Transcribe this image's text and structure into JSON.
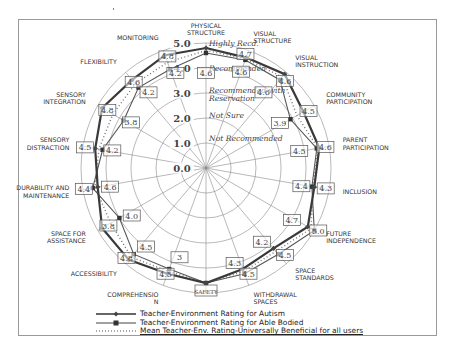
{
  "chart_data": {
    "type": "radar",
    "title": "",
    "axes": [
      "PHYSICAL STRUCTURE",
      "VISUAL STRUCTURE",
      "VISUAL INSTRUCTION",
      "COMMUNITY PARTICIPATION",
      "PARENT PARTICIPATION",
      "INCLUSION",
      "FUTURE INDEPENDENCE",
      "SPACE STANDARDS",
      "WITHDRAWAL SPACES",
      "SAFETY",
      "COMPREHENSION",
      "ACCESSIBILITY",
      "SPACE FOR ASSISTANCE",
      "DURABILITY AND MAINTENANCE",
      "SENSORY DISTRACTION",
      "SENSORY INTEGRATION",
      "FLEXIBILITY",
      "MONITORING"
    ],
    "axis_label_lines": [
      [
        "PHYSICAL",
        "STRUCTURE"
      ],
      [
        "VISUAL",
        "STRUCTURE"
      ],
      [
        "VISUAL",
        "INSTRUCTION"
      ],
      [
        "COMMUNITY",
        "PARTICIPATION"
      ],
      [
        "PARENT",
        "PARTICIPATION"
      ],
      [
        "INCLUSION"
      ],
      [
        "FUTURE",
        "INDEPENDENCE"
      ],
      [
        "SPACE",
        "STANDARDS"
      ],
      [
        "WITHDRAWAL",
        "SPACES"
      ],
      [
        "SAFETY"
      ],
      [
        "COMPREHENSIO",
        "N"
      ],
      [
        "ACCESSIBILITY"
      ],
      [
        "SPACE FOR",
        "ASSISTANCE"
      ],
      [
        "DURABILITY AND",
        "MAINTENANCE"
      ],
      [
        "SENSORY",
        "DISTRACTION"
      ],
      [
        "SENSORY",
        "INTEGRATION"
      ],
      [
        "FLEXIBILITY"
      ],
      [
        "MONITORING"
      ]
    ],
    "rlim": [
      0,
      5
    ],
    "ring_ticks": [
      "0.0",
      "1.0",
      "2.0",
      "3.0",
      "4.0",
      "5.0"
    ],
    "zone_labels": [
      {
        "text": "Highly Recd.",
        "r": 4.9
      },
      {
        "text": "Recommended",
        "r": 3.9
      },
      {
        "text": "Recommended with",
        "r": 3.0
      },
      {
        "text": "Reservation",
        "r": 2.7
      },
      {
        "text": "Not Sure",
        "r": 2.0
      },
      {
        "text": "Not Recommended",
        "r": 1.1
      }
    ],
    "series": [
      {
        "name": "Teacher-Environment Rating for Autism",
        "style": "solid-diamond",
        "values": [
          4.8,
          4.7,
          4.9,
          4.5,
          4.6,
          4.4,
          4.7,
          4.2,
          4.3,
          4.6,
          4.5,
          4.8,
          4.8,
          4.4,
          4.5,
          4.8,
          4.6,
          4.8
        ]
      },
      {
        "name": "Teacher-Environment Rating for Able Bodied",
        "style": "solid-square",
        "values": [
          4.6,
          4.6,
          4.6,
          3.9,
          4.5,
          4.3,
          5.0,
          4.5,
          4.5,
          4.6,
          4.3,
          4.5,
          4.0,
          4.6,
          4.2,
          3.8,
          4.2,
          4.2
        ]
      },
      {
        "name": "Mean Teacher-Env. Rating-Universally Beneficial for all_users",
        "style": "dotted",
        "values": [
          4.7,
          4.65,
          4.75,
          4.2,
          4.55,
          4.35,
          4.85,
          4.35,
          4.4,
          4.6,
          4.4,
          4.65,
          4.4,
          4.5,
          4.35,
          4.3,
          4.4,
          4.5
        ]
      }
    ],
    "value_boxes": [
      {
        "text": "4.6",
        "axis": 0,
        "r": 3.8,
        "dx": 0
      },
      {
        "text": "4.7",
        "axis": 1,
        "r": 4.85,
        "dx": -2
      },
      {
        "text": "4.6",
        "axis": 1,
        "r": 4.1,
        "dx": 0
      },
      {
        "text": "4.6",
        "axis": 2,
        "r": 4.55,
        "dx": 6
      },
      {
        "text": "4.6",
        "axis": 2,
        "r": 3.95,
        "dx": -6
      },
      {
        "text": "4.5",
        "axis": 3,
        "r": 4.55,
        "dx": 4
      },
      {
        "text": "3.9",
        "axis": 3,
        "r": 3.6,
        "dx": -4
      },
      {
        "text": "4.6",
        "axis": 4,
        "r": 4.85,
        "dx": 0
      },
      {
        "text": "4.5",
        "axis": 4,
        "r": 3.95,
        "dx": -4
      },
      {
        "text": "4.4",
        "axis": 5,
        "r": 4.2,
        "dx": -8
      },
      {
        "text": "4.3",
        "axis": 5,
        "r": 4.7,
        "dx": 4
      },
      {
        "text": "4.7",
        "axis": 6,
        "r": 4.15,
        "dx": -4
      },
      {
        "text": "5.0",
        "axis": 6,
        "r": 5.0,
        "dx": 4
      },
      {
        "text": "4.2",
        "axis": 7,
        "r": 3.85,
        "dx": -6
      },
      {
        "text": "4.5",
        "axis": 7,
        "r": 4.55,
        "dx": 6
      },
      {
        "text": "4.3",
        "axis": 8,
        "r": 4.05,
        "dx": -6
      },
      {
        "text": "4.5",
        "axis": 8,
        "r": 4.5,
        "dx": 4
      },
      {
        "text": "SAFETY",
        "axis": 9,
        "r": 4.9,
        "dx": 0
      },
      {
        "text": "3",
        "axis": 10,
        "r": 3.8,
        "dx": 6
      },
      {
        "text": "4.5",
        "axis": 10,
        "r": 4.5,
        "dx": -2
      },
      {
        "text": "4.5",
        "axis": 11,
        "r": 4.1,
        "dx": 6
      },
      {
        "text": "4.8",
        "axis": 11,
        "r": 4.7,
        "dx": -4
      },
      {
        "text": "4.0",
        "axis": 12,
        "r": 3.8,
        "dx": 8
      },
      {
        "text": "3.8",
        "axis": 12,
        "r": 4.6,
        "dx": 2
      },
      {
        "text": "4.6",
        "axis": 13,
        "r": 4.3,
        "dx": 10
      },
      {
        "text": "4.4",
        "axis": 13,
        "r": 4.8,
        "dx": -4
      },
      {
        "text": "4.5",
        "axis": 14,
        "r": 4.75,
        "dx": -4
      },
      {
        "text": "4.2",
        "axis": 14,
        "r": 4.05,
        "dx": 6
      },
      {
        "text": "4.8",
        "axis": 15,
        "r": 4.65,
        "dx": 2
      },
      {
        "text": "3.8",
        "axis": 15,
        "r": 3.65,
        "dx": 4
      },
      {
        "text": "4.6",
        "axis": 16,
        "r": 4.5,
        "dx": 0
      },
      {
        "text": "4.2",
        "axis": 16,
        "r": 3.95,
        "dx": 6
      },
      {
        "text": "4.8",
        "axis": 17,
        "r": 4.75,
        "dx": 2
      },
      {
        "text": "4.2",
        "axis": 17,
        "r": 4.05,
        "dx": 4
      }
    ]
  },
  "legend": {
    "items": [
      {
        "label": "Teacher-Environment Rating for Autism",
        "marker": "diamond-solid-line"
      },
      {
        "label": "Teacher-Environment Rating for Able Bodied",
        "marker": "square-solid-line"
      },
      {
        "label": "Mean Teacher-Env. Rating-Universally Beneficial for all users",
        "marker": "dotted-line"
      }
    ]
  },
  "colors": {
    "grid": "#8a8a8a",
    "series_autism": "#3a3a3a",
    "series_able": "#555555",
    "series_mean": "#777777",
    "frame": "#9a9a9a"
  }
}
